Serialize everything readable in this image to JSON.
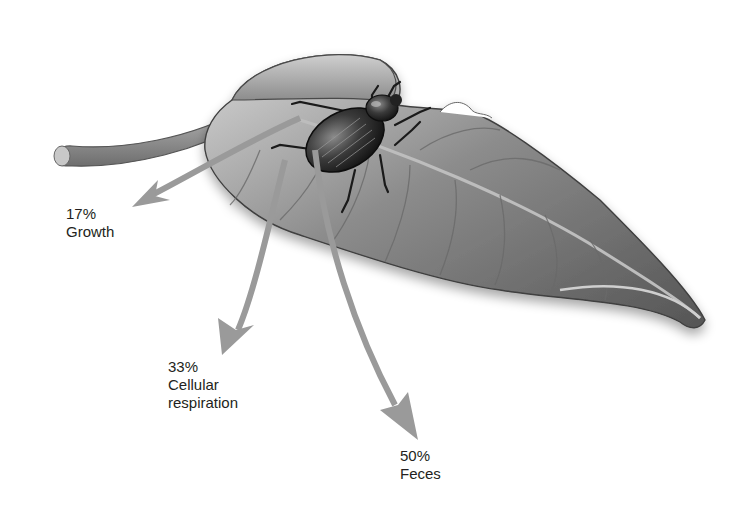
{
  "diagram": {
    "arrow_color": "#9a9a9a",
    "text_color": "#231f20",
    "labels": [
      {
        "id": "growth",
        "percent": "17%",
        "text": "Growth"
      },
      {
        "id": "respiration",
        "percent": "33%",
        "text": "Cellular",
        "text2": "respiration"
      },
      {
        "id": "feces",
        "percent": "50%",
        "text": "Feces"
      }
    ]
  }
}
